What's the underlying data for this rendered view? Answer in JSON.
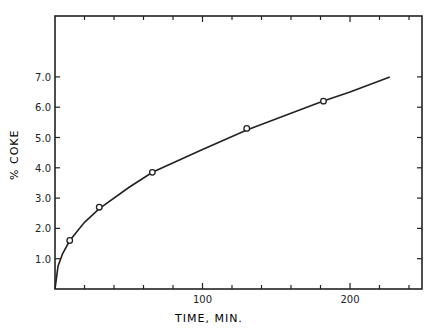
{
  "chart_data": {
    "type": "line",
    "title": "",
    "xlabel": "TIME, MIN.",
    "ylabel": "% COKE",
    "xlim": [
      0,
      249
    ],
    "ylim": [
      0,
      9.0
    ],
    "x_ticks": [
      100,
      200
    ],
    "x_tick_labels": [
      "100",
      "200"
    ],
    "y_ticks": [
      1.0,
      2.0,
      3.0,
      4.0,
      5.0,
      6.0,
      7.0
    ],
    "y_tick_labels": [
      "1.0",
      "2.0",
      "3.0",
      "4.0",
      "5.0",
      "6.0",
      "7.0"
    ],
    "grid": false,
    "legend": null,
    "series": [
      {
        "name": "measured",
        "style": "open-circle-markers",
        "x": [
          10,
          30,
          66,
          130,
          182
        ],
        "y": [
          1.6,
          2.7,
          3.85,
          5.3,
          6.2
        ]
      },
      {
        "name": "fitted curve",
        "style": "solid-line",
        "x": [
          0,
          2,
          5,
          10,
          20,
          30,
          50,
          66,
          100,
          130,
          160,
          182,
          200,
          227
        ],
        "y": [
          0,
          0.75,
          1.15,
          1.6,
          2.2,
          2.65,
          3.35,
          3.85,
          4.6,
          5.25,
          5.8,
          6.2,
          6.5,
          7.0
        ]
      }
    ]
  }
}
